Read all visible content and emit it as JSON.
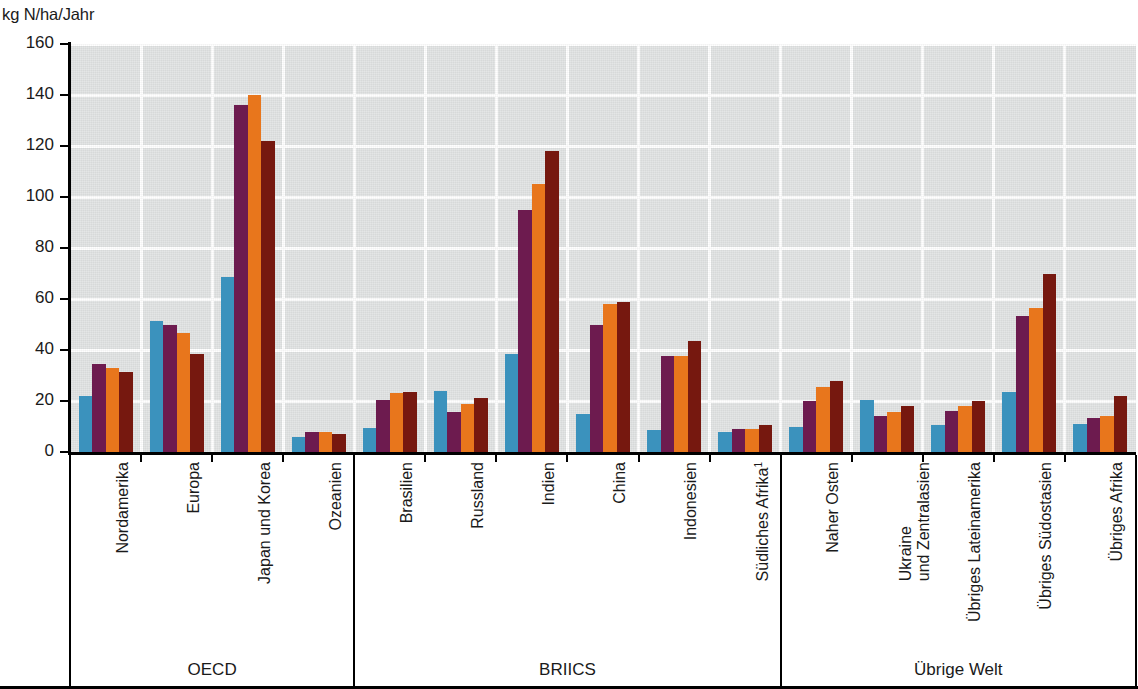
{
  "chart_data": {
    "type": "bar",
    "title": "",
    "subtitle": "",
    "xlabel": "",
    "ylabel": "kg N/ha/Jahr",
    "ylim": [
      0,
      160
    ],
    "yticks": [
      0,
      20,
      40,
      60,
      80,
      100,
      120,
      140,
      160
    ],
    "ytick_labels": [
      "0",
      "20",
      "40",
      "60",
      "80",
      "100",
      "120",
      "140",
      "160"
    ],
    "grid": true,
    "legend": "none",
    "orientation": "vertical",
    "grouped": true,
    "series_colors": [
      "#3b92bd",
      "#6d1b4f",
      "#e8761c",
      "#76180f"
    ],
    "series": [
      {
        "name": "series-1",
        "color": "#3b92bd",
        "values": [
          22,
          51.5,
          68.5,
          6,
          9.5,
          24,
          38.5,
          15,
          8.5,
          8,
          10,
          20.5,
          10.5,
          23.5,
          11
        ]
      },
      {
        "name": "series-2",
        "color": "#6d1b4f",
        "values": [
          34.5,
          50,
          136,
          8,
          20.5,
          15.5,
          95,
          50,
          37.5,
          9,
          20,
          14,
          16,
          53.5,
          13.5
        ]
      },
      {
        "name": "series-3",
        "color": "#e8761c",
        "values": [
          33,
          46.5,
          140,
          8,
          23,
          19,
          105,
          58,
          37.5,
          9,
          25.5,
          15.5,
          18,
          56.5,
          14
        ]
      },
      {
        "name": "series-4",
        "color": "#76180f",
        "values": [
          31.5,
          38.5,
          122,
          7,
          23.5,
          21,
          118,
          59,
          43.5,
          10.5,
          28,
          18,
          20,
          70,
          22
        ]
      }
    ],
    "categories": [
      {
        "label": "Nordamerika",
        "line2": "",
        "footnote": "",
        "group": "OECD"
      },
      {
        "label": "Europa",
        "line2": "",
        "footnote": "",
        "group": "OECD"
      },
      {
        "label": "Japan und Korea",
        "line2": "",
        "footnote": "",
        "group": "OECD"
      },
      {
        "label": "Ozeanien",
        "line2": "",
        "footnote": "",
        "group": "OECD"
      },
      {
        "label": "Brasilien",
        "line2": "",
        "footnote": "",
        "group": "BRIICS"
      },
      {
        "label": "Russland",
        "line2": "",
        "footnote": "",
        "group": "BRIICS"
      },
      {
        "label": "Indien",
        "line2": "",
        "footnote": "",
        "group": "BRIICS"
      },
      {
        "label": "China",
        "line2": "",
        "footnote": "",
        "group": "BRIICS"
      },
      {
        "label": "Indonesien",
        "line2": "",
        "footnote": "",
        "group": "BRIICS"
      },
      {
        "label": "Südliches Afrika",
        "line2": "",
        "footnote": "1",
        "group": "BRIICS"
      },
      {
        "label": "Naher Osten",
        "line2": "",
        "footnote": "",
        "group": "Übrige Welt"
      },
      {
        "label": "Ukraine",
        "line2": "und Zentralasien",
        "footnote": "",
        "group": "Übrige Welt"
      },
      {
        "label": "Übriges Lateinamerika",
        "line2": "",
        "footnote": "",
        "group": "Übrige Welt"
      },
      {
        "label": "Übriges Südostasien",
        "line2": "",
        "footnote": "",
        "group": "Übrige Welt"
      },
      {
        "label": "Übriges Afrika",
        "line2": "",
        "footnote": "",
        "group": "Übrige Welt"
      }
    ],
    "groups": [
      {
        "label": "OECD",
        "start": 0,
        "end": 3
      },
      {
        "label": "BRIICS",
        "start": 4,
        "end": 9
      },
      {
        "label": "Übrige Welt",
        "start": 10,
        "end": 14
      }
    ]
  },
  "axis": {
    "unit_label": "kg N/ha/Jahr"
  }
}
